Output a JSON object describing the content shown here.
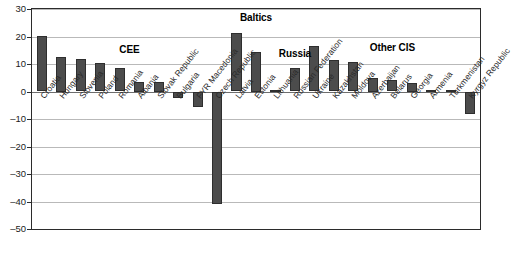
{
  "chart_data": {
    "type": "bar",
    "title": "",
    "subtitle": "",
    "xlabel": "",
    "ylabel": "",
    "ylim": [
      -50,
      30
    ],
    "yticks": [
      30,
      20,
      10,
      0,
      -10,
      -20,
      -30,
      -40,
      -50
    ],
    "grid": true,
    "legend": "none",
    "bar_color": "#4c4c4c",
    "categories": [
      "Croatia",
      "Hungary",
      "Slovenia",
      "Poland",
      "Romania",
      "Albania",
      "Slovak Republic",
      "Bulgaria",
      "FYR Macedonia",
      "Czech Republic",
      "Latvia",
      "Estonia",
      "Lithuania",
      "Russian Federation",
      "Ukraine",
      "Kazakhstan",
      "Moldova",
      "Azerbaijan",
      "Belarus",
      "Georgia",
      "Armenia",
      "Turkmenistan",
      "Kyrgyz Republic"
    ],
    "values": [
      20.2,
      12.5,
      11.9,
      10.2,
      8.7,
      3.5,
      3.5,
      -2.2,
      -5.5,
      -41.0,
      21.2,
      14.5,
      0.6,
      8.6,
      16.4,
      11.4,
      10.8,
      5.0,
      4.1,
      3.0,
      0.6,
      0.4,
      -8.0
    ],
    "groups": [
      {
        "label": "CEE",
        "start_index": 0,
        "end_index": 9
      },
      {
        "label": "Baltics",
        "start_index": 10,
        "end_index": 12
      },
      {
        "label": "Russia",
        "start_index": 13,
        "end_index": 13
      },
      {
        "label": "Other CIS",
        "start_index": 14,
        "end_index": 22
      }
    ]
  }
}
